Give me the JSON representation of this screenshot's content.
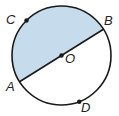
{
  "diagram": {
    "type": "circle-with-diameter",
    "colors": {
      "shade": "#c6dcec",
      "stroke": "#1a1a1a",
      "background": "#ffffff"
    },
    "center_label": "O",
    "diameter": [
      "A",
      "B"
    ],
    "shaded_region": "semicircle ACB",
    "points": [
      {
        "id": "A",
        "label": "A",
        "role": "diameter endpoint"
      },
      {
        "id": "B",
        "label": "B",
        "role": "diameter endpoint"
      },
      {
        "id": "C",
        "label": "C",
        "role": "point on upper arc"
      },
      {
        "id": "D",
        "label": "D",
        "role": "point on lower arc"
      },
      {
        "id": "O",
        "label": "O",
        "role": "center"
      }
    ]
  }
}
